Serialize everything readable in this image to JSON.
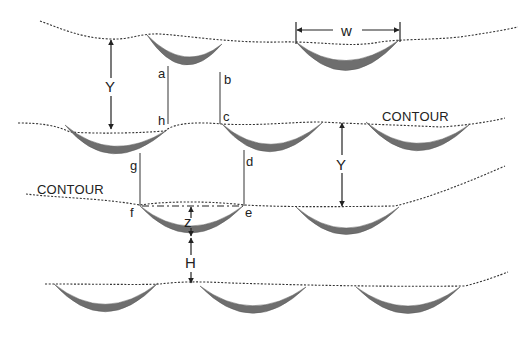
{
  "diagram": {
    "type": "contour trench / half-moon bund layout",
    "labels": {
      "contour_upper": "CONTOUR",
      "contour_left": "CONTOUR",
      "spacing_vertical_1": "Y",
      "spacing_vertical_2": "Y",
      "width": "w",
      "depth": "z",
      "height_gap": "H"
    },
    "points": {
      "a": "a",
      "b": "b",
      "c": "c",
      "d": "d",
      "e": "e",
      "f": "f",
      "g": "g",
      "h": "h"
    },
    "rows": [
      {
        "row": 1,
        "structures": 2
      },
      {
        "row": 2,
        "structures": 3
      },
      {
        "row": 3,
        "structures": 2
      },
      {
        "row": 4,
        "structures": 3
      }
    ],
    "colors": {
      "structure_fill": "#6e6e6e",
      "contour_line": "#333333",
      "background": "#ffffff"
    }
  }
}
